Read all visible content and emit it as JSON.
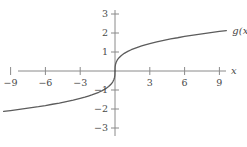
{
  "chart_data": {
    "type": "line",
    "title": "",
    "xlabel": "x",
    "ylabel": "",
    "curve_label": "g(x)",
    "function": "cube-root",
    "grid": false,
    "legend_position": "curve-end-right",
    "xlim": [
      -10.9,
      11.6
    ],
    "ylim": [
      -3.6,
      3.9
    ],
    "x_ticks": [
      -9,
      -6,
      -3,
      3,
      6,
      9
    ],
    "x_tick_labels": [
      "−9",
      "−6",
      "−3",
      "3",
      "6",
      "9"
    ],
    "y_ticks": [
      -3,
      -2,
      -1,
      1,
      2,
      3
    ],
    "y_tick_labels": [
      "−3",
      "−2",
      "−1",
      "1",
      "2",
      "3"
    ],
    "series": [
      {
        "name": "g(x)",
        "x": [
          -9.6,
          -9.0,
          -8.4,
          -7.8,
          -7.2,
          -6.6,
          -6.0,
          -5.4,
          -4.8,
          -4.2,
          -3.6,
          -3.0,
          -2.6,
          -2.3,
          -2.0,
          -1.7,
          -1.4,
          -1.1,
          -0.8,
          -0.55,
          -0.35,
          -0.2,
          -0.1,
          -0.04,
          -0.01,
          0,
          0.01,
          0.04,
          0.1,
          0.2,
          0.35,
          0.55,
          0.8,
          1.1,
          1.4,
          1.7,
          2.0,
          2.3,
          2.6,
          3.0,
          3.6,
          4.2,
          4.8,
          5.4,
          6.0,
          6.6,
          7.2,
          7.8,
          8.4,
          9.0,
          9.6
        ],
        "y": [
          -2.13,
          -2.08,
          -2.03,
          -1.98,
          -1.93,
          -1.88,
          -1.82,
          -1.75,
          -1.69,
          -1.61,
          -1.53,
          -1.44,
          -1.38,
          -1.32,
          -1.26,
          -1.19,
          -1.12,
          -1.03,
          -0.93,
          -0.82,
          -0.7,
          -0.58,
          -0.46,
          -0.34,
          -0.22,
          0,
          0.22,
          0.34,
          0.46,
          0.58,
          0.7,
          0.82,
          0.93,
          1.03,
          1.12,
          1.19,
          1.26,
          1.32,
          1.38,
          1.44,
          1.53,
          1.61,
          1.69,
          1.75,
          1.82,
          1.88,
          1.93,
          1.98,
          2.03,
          2.08,
          2.13
        ]
      }
    ],
    "colors": {
      "curve": "#5c5c5c",
      "axis": "#8a8a8a",
      "label": "#4a4a4a",
      "background": "#ffffff"
    }
  },
  "geometry": {
    "origin_x": 115,
    "origin_y": 71,
    "unit_x": 11.6,
    "unit_y": 19.0,
    "x_axis_start": 18,
    "x_axis_end": 226,
    "y_axis_top": 10,
    "y_axis_bottom": 136
  }
}
